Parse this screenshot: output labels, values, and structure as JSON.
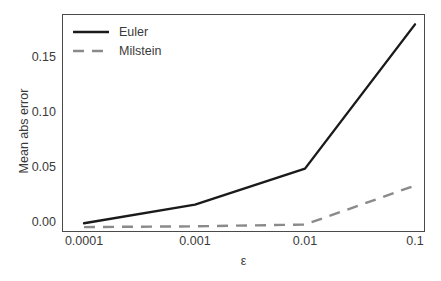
{
  "chart_data": {
    "type": "line",
    "title": "",
    "xlabel": "ε",
    "ylabel": "Mean abs error",
    "x_categories": [
      "0.0001",
      "0.001",
      "0.01",
      "0.1"
    ],
    "x_values": [
      0.0001,
      0.001,
      0.01,
      0.1
    ],
    "x_scale": "log",
    "xticklabels": [
      "0.0001",
      "0.001",
      "0.01",
      "0.1"
    ],
    "yticklabels": [
      "0.00",
      "0.05",
      "0.10",
      "0.15"
    ],
    "ytickvalues": [
      0.0,
      0.05,
      0.1,
      0.15
    ],
    "ylim": [
      -0.004,
      0.1955
    ],
    "grid": false,
    "legend_position": "upper left",
    "series": [
      {
        "name": "Euler",
        "values": [
          0.004,
          0.021,
          0.054,
          0.186
        ],
        "color": "#1a1a1a",
        "linestyle": "solid",
        "linewidth": 2.2
      },
      {
        "name": "Milstein",
        "values": [
          0.0005,
          0.0012,
          0.0028,
          0.0385
        ],
        "color": "#8a8a8a",
        "linestyle": "dashed",
        "linewidth": 2.2
      }
    ]
  },
  "axes": {
    "frame_color": "#4a4a4a",
    "background": "#ffffff"
  }
}
